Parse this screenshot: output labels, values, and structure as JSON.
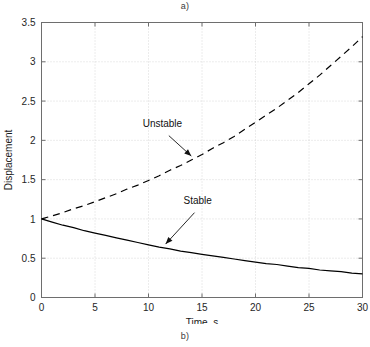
{
  "figure": {
    "label_top": "a)",
    "label_bottom": "b)"
  },
  "chart_data": {
    "type": "line",
    "title": "",
    "xlabel": "Time, s",
    "ylabel": "Displacement",
    "xlim": [
      0,
      30
    ],
    "ylim": [
      0,
      3.5
    ],
    "xticks": [
      "0",
      "5",
      "10",
      "15",
      "20",
      "25",
      "30"
    ],
    "yticks": [
      "0",
      "0.5",
      "1",
      "1.5",
      "2",
      "2.5",
      "3",
      "3.5"
    ],
    "xtick_values": [
      0,
      5,
      10,
      15,
      20,
      25,
      30
    ],
    "ytick_values": [
      0,
      0.5,
      1,
      1.5,
      2,
      2.5,
      3,
      3.5
    ],
    "grid": true,
    "grid_style": "dotted",
    "grid_color": "#c8c8c8",
    "legend": "none",
    "axis_color": "#6e6e6e",
    "series": [
      {
        "name": "Unstable",
        "style": "dashed",
        "color": "#000000",
        "x": [
          0,
          1,
          2,
          3,
          4,
          5,
          6,
          7,
          8,
          9,
          10,
          11,
          12,
          13,
          14,
          15,
          16,
          17,
          18,
          19,
          20,
          21,
          22,
          23,
          24,
          25,
          26,
          27,
          28,
          29,
          30
        ],
        "values": [
          1.0,
          1.04,
          1.08,
          1.13,
          1.17,
          1.22,
          1.27,
          1.32,
          1.38,
          1.43,
          1.49,
          1.55,
          1.62,
          1.68,
          1.75,
          1.82,
          1.9,
          1.97,
          2.05,
          2.14,
          2.23,
          2.32,
          2.41,
          2.51,
          2.61,
          2.72,
          2.83,
          2.95,
          3.07,
          3.19,
          3.32
        ]
      },
      {
        "name": "Stable",
        "style": "solid",
        "color": "#000000",
        "x": [
          0,
          1,
          2,
          3,
          4,
          5,
          6,
          7,
          8,
          9,
          10,
          11,
          12,
          13,
          14,
          15,
          16,
          17,
          18,
          19,
          20,
          21,
          22,
          23,
          24,
          25,
          26,
          27,
          28,
          29,
          30
        ],
        "values": [
          1.0,
          0.96,
          0.92,
          0.89,
          0.85,
          0.82,
          0.79,
          0.76,
          0.73,
          0.7,
          0.67,
          0.64,
          0.62,
          0.59,
          0.57,
          0.55,
          0.53,
          0.51,
          0.49,
          0.47,
          0.45,
          0.43,
          0.42,
          0.4,
          0.38,
          0.37,
          0.35,
          0.34,
          0.33,
          0.31,
          0.3
        ]
      }
    ],
    "annotations": [
      {
        "text": "Unstable",
        "text_x": 11.3,
        "text_y": 2.17,
        "arrow_from_x": 11.9,
        "arrow_from_y": 2.06,
        "arrow_to_x": 14.0,
        "arrow_to_y": 1.8
      },
      {
        "text": "Stable",
        "text_x": 14.6,
        "text_y": 1.19,
        "arrow_from_x": 14.3,
        "arrow_from_y": 1.08,
        "arrow_to_x": 11.6,
        "arrow_to_y": 0.68
      }
    ]
  }
}
